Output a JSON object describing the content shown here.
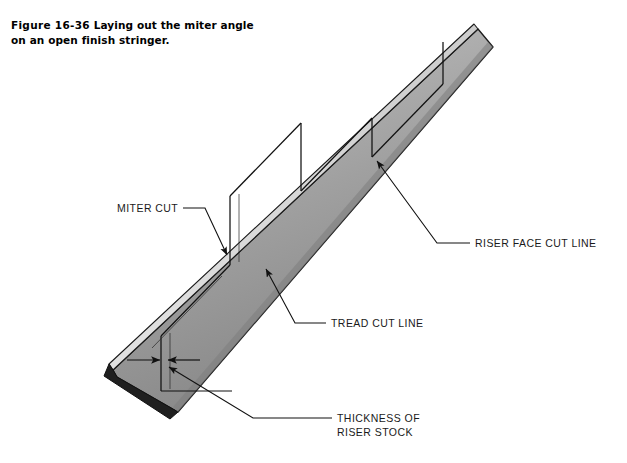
{
  "figure": {
    "number": "Figure 16-36",
    "caption": "Laying out the miter angle on an open finish stringer.",
    "caption_line1": "Laying out the miter angle on an",
    "caption_line2": "open finish stringer."
  },
  "callouts": {
    "miter_cut": "MITER CUT",
    "riser_face_cut_line": "RISER FACE CUT LINE",
    "tread_cut_line": "TREAD CUT LINE",
    "thickness_line1": "THICKNESS OF",
    "thickness_line2": "RISER STOCK"
  },
  "colors": {
    "background": "#ffffff",
    "board_light": "#c6c6c6",
    "board_mid": "#9e9e9e",
    "board_dark": "#8a8a8a",
    "board_edge_dark": "#6f6f6f",
    "end_grain_black": "#1b1b1b",
    "top_face": "#d2d2d2",
    "outline": "#1a1a1a",
    "layout_line": "#111111",
    "text": "#1a1a1a"
  },
  "diagram": {
    "orientation": "diagonal, lower-left to upper-right",
    "step_count": 4,
    "features": [
      "mitered end cut at lower-left",
      "square cut end at upper-right",
      "sawtooth tread and riser layout lines",
      "riser stock thickness dimension arrows"
    ]
  }
}
